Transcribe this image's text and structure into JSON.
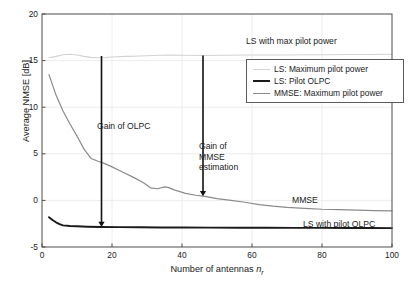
{
  "chart_data": {
    "type": "line",
    "title": "",
    "xlabel": "Number of antennas n_r",
    "xlabel_main": "Number of antennas ",
    "xlabel_var": "n",
    "xlabel_sub": "r",
    "ylabel": "Average NMSE [dB]",
    "xlim": [
      0,
      100
    ],
    "ylim": [
      -5,
      20
    ],
    "xticks": [
      0,
      20,
      40,
      60,
      80,
      100
    ],
    "yticks": [
      -5,
      0,
      5,
      10,
      15,
      20
    ],
    "xtick_labels": [
      "0",
      "20",
      "40",
      "60",
      "80",
      "100"
    ],
    "ytick_labels": [
      "-5",
      "0",
      "5",
      "10",
      "15",
      "20"
    ],
    "grid": true,
    "legend_position": "upper right",
    "series": [
      {
        "name": "LS: Maximum pilot power",
        "color": "#d2d2d2",
        "width": 1.1,
        "x": [
          2,
          4,
          6,
          8,
          10,
          12,
          14,
          16,
          18,
          20,
          24,
          28,
          32,
          36,
          40,
          46,
          52,
          58,
          64,
          70,
          76,
          82,
          88,
          94,
          100
        ],
        "y": [
          15.3,
          15.45,
          15.62,
          15.68,
          15.6,
          15.45,
          15.35,
          15.3,
          15.32,
          15.38,
          15.45,
          15.5,
          15.55,
          15.6,
          15.58,
          15.55,
          15.57,
          15.6,
          15.6,
          15.6,
          15.62,
          15.63,
          15.65,
          15.66,
          15.68
        ]
      },
      {
        "name": "LS: Pilot OLPC",
        "color": "#1a1a1a",
        "width": 1.9,
        "x": [
          2,
          3,
          4,
          5,
          6,
          8,
          10,
          13,
          17,
          22,
          28,
          34,
          40,
          48,
          56,
          64,
          72,
          80,
          88,
          94,
          100
        ],
        "y": [
          -1.8,
          -2.1,
          -2.35,
          -2.55,
          -2.68,
          -2.75,
          -2.78,
          -2.82,
          -2.85,
          -2.87,
          -2.88,
          -2.9,
          -2.9,
          -2.92,
          -2.93,
          -2.94,
          -2.95,
          -2.95,
          -2.96,
          -2.96,
          -2.97
        ]
      },
      {
        "name": "MMSE: Maximum pilot power",
        "color": "#8a8a8a",
        "width": 1.2,
        "x": [
          2,
          4,
          6,
          8,
          10,
          12,
          14,
          16,
          18,
          20,
          23,
          26,
          29,
          31,
          33,
          35,
          36,
          38,
          41,
          44,
          47,
          50,
          54,
          58,
          62,
          66,
          70,
          75,
          80,
          85,
          90,
          95,
          100
        ],
        "y": [
          13.5,
          11.3,
          9.6,
          8.2,
          6.9,
          5.5,
          4.5,
          4.2,
          3.95,
          3.6,
          3.05,
          2.5,
          1.9,
          1.35,
          1.25,
          1.45,
          1.4,
          1.1,
          0.75,
          0.55,
          0.4,
          0.2,
          0.0,
          -0.2,
          -0.45,
          -0.62,
          -0.75,
          -0.85,
          -0.95,
          -1.0,
          -1.05,
          -1.1,
          -1.12
        ]
      }
    ],
    "annotations": [
      {
        "name": "ls-max-pilot-power-label",
        "text": "LS with max pilot power",
        "x_px": 246,
        "y_px": 36
      },
      {
        "name": "gain-of-olpc-label",
        "text": "Gain of OLPC",
        "x_px": 97,
        "y_px": 121
      },
      {
        "name": "gain-of-mmse-estimation-label",
        "text": "Gain of\nMMSE\nestimation",
        "line1": "Gain of",
        "line2": "MMSE",
        "line3": "estimation",
        "x_px": 199,
        "y_px": 141
      },
      {
        "name": "mmse-curve-label",
        "text": "MMSE",
        "x_px": 292,
        "y_px": 195
      },
      {
        "name": "ls-with-pilot-olpc-label",
        "text": "LS with pilot OLPC",
        "x_px": 303,
        "y_px": 219
      }
    ],
    "arrows": [
      {
        "name": "gain-of-olpc-arrow",
        "x": 17,
        "y_start": 15.5,
        "y_end": -2.85
      },
      {
        "name": "gain-of-mmse-arrow",
        "x": 46,
        "y_start": 15.55,
        "y_end": 0.45
      }
    ]
  },
  "legend": {
    "items": [
      {
        "label": "LS: Maximum pilot power",
        "color": "#d2d2d2",
        "width": 1.1
      },
      {
        "label": "LS: Pilot OLPC",
        "color": "#1a1a1a",
        "width": 2.0
      },
      {
        "label": "MMSE: Maximum pilot power",
        "color": "#8a8a8a",
        "width": 1.3
      }
    ]
  },
  "axes": {
    "frame_color": "#4d4d4d",
    "grid_color": "#ececec"
  }
}
